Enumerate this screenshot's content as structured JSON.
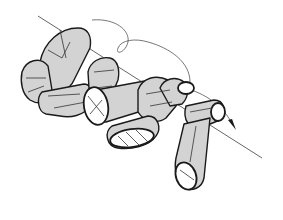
{
  "figure": {
    "colors": {
      "background": "#ffffff",
      "segment_fill": "#d3d3d3",
      "outline": "#1a1a1a",
      "axis_line": "#555555"
    },
    "elements": {
      "axis": "diagonal-axis-line",
      "rotation_arrow": "curved-rotation-arrow",
      "segments_count": 7
    }
  }
}
